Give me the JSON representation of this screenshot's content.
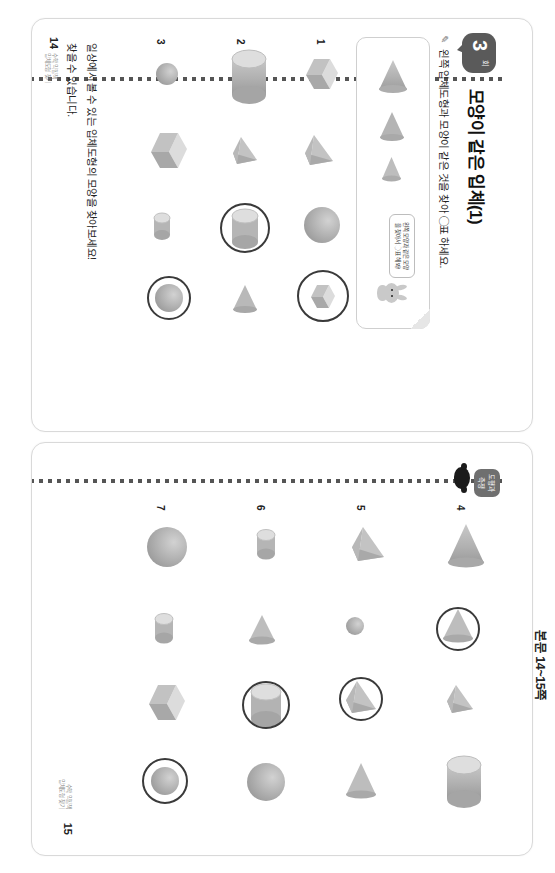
{
  "document": {
    "header_note": "본문 14~15쪽",
    "side_tab": "도형과 측정",
    "chapter_badge_number": "3",
    "chapter_badge_unit": "회",
    "title": "모양이 같은 입체(1)",
    "instruction": "왼쪽 입체도형과 모양이 같은 것을 찾아 ◯표 하세요.",
    "pencil_icon": "pencil-icon"
  },
  "example_box": {
    "bubble_text": "왼쪽 모양과 같은 모양을 찾아서 ◯표 해 봐!",
    "mascot": "bunny-mascot",
    "sample_shapes": [
      "cone",
      "cone",
      "cone"
    ]
  },
  "left_page": {
    "page_number": "14",
    "footer_line1": "일상에서 볼 수 있는 입체도형의 모양을 찾아보세요!",
    "footer_line2": "찾을 수 있습니다.",
    "footer_small": "수학 익힘책\n입체도형 찾기",
    "rows": [
      {
        "number": "1",
        "prompt": "cube",
        "options": [
          "cube",
          "triangular-pyramid",
          "sphere",
          "cube"
        ],
        "circled_index": 3
      },
      {
        "number": "2",
        "prompt": "cylinder",
        "options": [
          "cylinder",
          "triangular-pyramid",
          "cylinder",
          "cone"
        ],
        "circled_index": 2
      },
      {
        "number": "3",
        "prompt": "sphere",
        "options": [
          "sphere",
          "cube",
          "cylinder",
          "sphere"
        ],
        "circled_index": 3
      }
    ]
  },
  "right_page": {
    "page_number": "15",
    "footer_small": "수학 익힘책\n입체도형 찾기",
    "rows": [
      {
        "number": "4",
        "prompt": "cone",
        "options": [
          "cone",
          "cone",
          "triangular-pyramid",
          "cylinder"
        ],
        "circled_index": 1
      },
      {
        "number": "5",
        "prompt": "triangular-pyramid",
        "options": [
          "triangular-pyramid",
          "sphere",
          "triangular-pyramid",
          "cone"
        ],
        "circled_index": 2
      },
      {
        "number": "6",
        "prompt": "cylinder",
        "options": [
          "cylinder",
          "cone",
          "cylinder",
          "sphere"
        ],
        "circled_index": 2
      },
      {
        "number": "7",
        "prompt": "sphere",
        "options": [
          "sphere",
          "cylinder",
          "cube",
          "sphere"
        ],
        "circled_index": 3
      }
    ]
  },
  "colors": {
    "shape_light": "#d6d6d6",
    "shape_mid": "#b4b4b4",
    "shape_dark": "#9a9a9a",
    "ring": "#3a3a3a",
    "badge": "#5a5a5a",
    "tab": "#6f6f6f"
  }
}
